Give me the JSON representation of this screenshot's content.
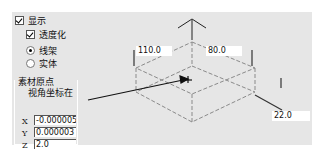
{
  "display": {
    "show_label": "显示",
    "show_checked": true,
    "transparent_label": "透度化",
    "transparent_checked": true,
    "render_mode": {
      "options": [
        "线架",
        "实体"
      ],
      "selected": "线架"
    }
  },
  "origin_group": {
    "title": "素材原点",
    "subtitle": "视角坐标在",
    "x_label": "X",
    "x_value": "-0.000005",
    "y_label": "Y",
    "y_value": "0.000003",
    "z_label": "Z",
    "z_value": "2.0"
  },
  "diagram": {
    "dim_width": "110.0",
    "dim_depth": "80.0",
    "dim_height": "22.0"
  },
  "colors": {
    "panel_bg": "#e6e6e6",
    "dashed_line": "#8a8a8a",
    "arrow": "#111111"
  }
}
